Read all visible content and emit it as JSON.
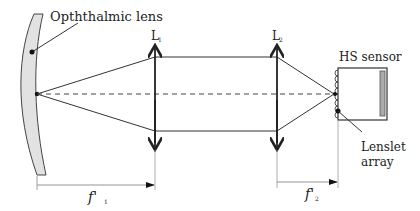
{
  "diagram": {
    "labels": {
      "ophthalmic_lens": "Opththalmic lens",
      "lens1": "L",
      "lens1_sub": "1",
      "lens2": "L",
      "lens2_sub": "2",
      "hs_sensor": "HS sensor",
      "lenslet_line1": "Lenslet",
      "lenslet_line2": "array",
      "f1": "f'",
      "f1_sub": "1",
      "f2": "f'",
      "f2_sub": "2"
    },
    "colors": {
      "line": "#333333",
      "lens_fill": "#e0e0e0",
      "detector_fill": "#aaaaaa",
      "dimension_line": "#888888"
    }
  }
}
